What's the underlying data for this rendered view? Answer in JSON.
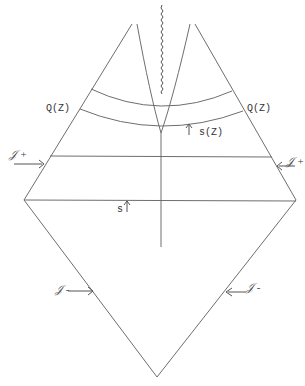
{
  "diagram": {
    "type": "conformal-diagram",
    "colors": {
      "stroke": "#6e6e6e",
      "text": "#333333",
      "background": "#ffffff"
    },
    "labels": {
      "q_left": "Q(Z)",
      "q_right": "Q(Z)",
      "s_tau": "s(Z)",
      "s": "s",
      "scri_plus_left": "𝒥 +",
      "scri_plus_right": "𝒥 +",
      "scri_minus_left": "𝒥 -",
      "scri_minus_right": "𝒥 -"
    },
    "vertices": {
      "left": [
        24,
        200
      ],
      "right": [
        296,
        200
      ],
      "bottom": [
        157,
        377
      ],
      "top_left": [
        132,
        24
      ],
      "top_right": [
        195,
        24
      ],
      "inner_join": [
        161,
        133
      ]
    },
    "horizontal_lines_y": [
      156,
      200
    ],
    "arcs": [
      {
        "from": [
          91,
          89
        ],
        "to": [
          232,
          91
        ],
        "sag_y": 105
      },
      {
        "from": [
          80,
          109
        ],
        "to": [
          243,
          111
        ],
        "sag_y": 125
      }
    ]
  }
}
